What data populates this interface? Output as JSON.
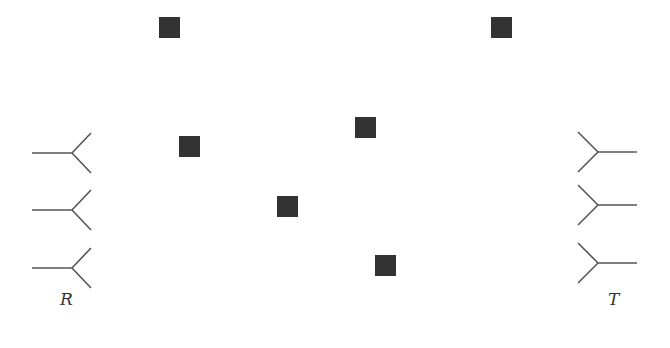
{
  "diagram": {
    "receiver_label": "R",
    "transmitter_label": "T",
    "colors": {
      "line": "#555555",
      "scatterer": "#333333"
    },
    "receiver_antennas": [
      {
        "y": 153
      },
      {
        "y": 210
      },
      {
        "y": 268
      }
    ],
    "transmitter_antennas": [
      {
        "y": 152
      },
      {
        "y": 205
      },
      {
        "y": 263
      }
    ],
    "scatterers": [
      {
        "x": 159,
        "y": 17
      },
      {
        "x": 179,
        "y": 136
      },
      {
        "x": 355,
        "y": 117
      },
      {
        "x": 277,
        "y": 196
      },
      {
        "x": 375,
        "y": 255
      },
      {
        "x": 491,
        "y": 17
      }
    ]
  }
}
